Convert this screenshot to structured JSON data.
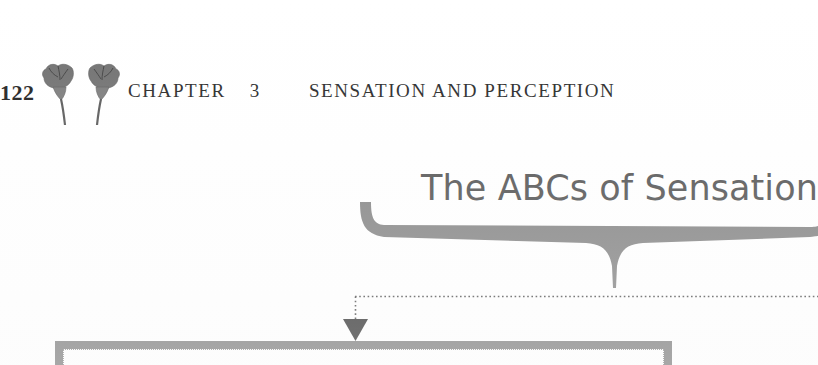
{
  "page": {
    "folio": "122",
    "ornament_icon": "twin-flower-ornament-icon",
    "background_color": "#ffffff"
  },
  "running_head": {
    "chapter_label": "CHAPTER",
    "chapter_number": "3",
    "chapter_title": "SENSATION AND PERCEPTION",
    "text_color": "#242424"
  },
  "section": {
    "title": "The ABCs of Sensation",
    "title_color": "#4d4d4d"
  },
  "diagram": {
    "brace_icon": "horizontal-curly-brace-icon",
    "brace_color": "#808080",
    "connector_icon": "dotted-elbow-connector-icon",
    "connector_color": "#555555",
    "arrow_icon": "down-triangle-arrow-icon",
    "arrow_color": "#333333",
    "box_icon": "content-box-outline",
    "box_border_color": "#7c7c7c",
    "box_inner_dash_color": "#8e8e8e",
    "box_fill_color": "#ffffff"
  }
}
